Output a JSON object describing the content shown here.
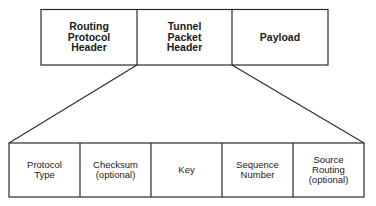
{
  "diagram": {
    "title": "",
    "top_row": {
      "cells": [
        {
          "label": "Routing\nProtocol\nHeader"
        },
        {
          "label": "Tunnel\nPacket\nHeader"
        },
        {
          "label": "Payload"
        }
      ]
    },
    "bottom_row": {
      "cells": [
        {
          "label": "Protocol\nType"
        },
        {
          "label": "Checksum\n(optional)"
        },
        {
          "label": "Key"
        },
        {
          "label": "Sequence\nNumber"
        },
        {
          "label": "Source\nRouting\n(optional)"
        }
      ]
    },
    "expansion": {
      "from": "Tunnel\nPacket\nHeader",
      "to": "bottom_row"
    },
    "colors": {
      "line": "#2a2a2a",
      "background": "#ffffff",
      "text": "#1a1a1a"
    }
  }
}
